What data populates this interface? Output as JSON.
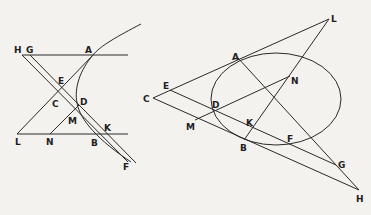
{
  "figure_left": {
    "type": "hyperbola-construction",
    "labels": {
      "H": "H",
      "G": "G",
      "A": "A",
      "E": "E",
      "C": "C",
      "D": "D",
      "M": "M",
      "L": "L",
      "N": "N",
      "B": "B",
      "K": "K",
      "F": "F"
    }
  },
  "figure_right": {
    "type": "ellipse-construction",
    "labels": {
      "L": "L",
      "A": "A",
      "N": "N",
      "E": "E",
      "C": "C",
      "D": "D",
      "M": "M",
      "K": "K",
      "B": "B",
      "F": "F",
      "G": "G",
      "H": "H"
    }
  },
  "colors": {
    "background": "#f3f2ee",
    "ink": "#2a2a2a"
  }
}
